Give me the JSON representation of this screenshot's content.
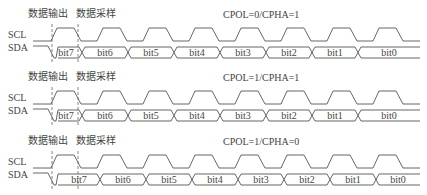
{
  "diagram": {
    "annotations": {
      "data_output": "数据输出",
      "data_sample": "数据采样"
    },
    "signal_labels": {
      "clock": "SCL",
      "data": "SDA"
    },
    "bits": [
      "bit7",
      "bit6",
      "bit5",
      "bit4",
      "bit3",
      "bit2",
      "bit1",
      "bit0"
    ],
    "colors": {
      "line": "#555555",
      "dashed": "#666666",
      "text": "#444444"
    },
    "panels": [
      {
        "mode": "CPOL=0/CPHA=1",
        "top": 0
      },
      {
        "mode": "CPOL=1/CPHA=1",
        "top": 64
      },
      {
        "mode": "CPOL=1/CPHA=0",
        "top": 128
      }
    ]
  }
}
